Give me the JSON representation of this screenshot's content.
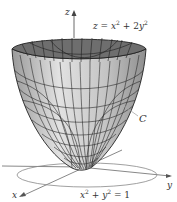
{
  "figure": {
    "type": "3d-surface",
    "surface_equation": {
      "lhs": "z",
      "eq": " = ",
      "t1": "x",
      "p1": "2",
      "plus": " + 2",
      "t2": "y",
      "p2": "2"
    },
    "curve_equation": {
      "t1": "x",
      "p1": "2",
      "plus": " + ",
      "t2": "y",
      "p2": "2",
      "rhs": " = 1"
    },
    "curve_label": "C",
    "axes": {
      "z": "z",
      "x": "x",
      "y": "y"
    },
    "colors": {
      "surface_outer": "#c8c8c8",
      "surface_inner": "#6e6e6e",
      "mesh": "#2a2a2a",
      "axis": "#444444",
      "circle": "#888888"
    }
  }
}
